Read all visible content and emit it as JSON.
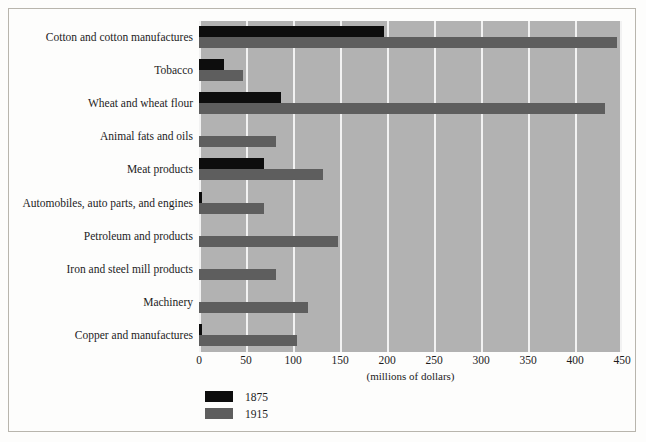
{
  "chart_data": {
    "type": "bar",
    "orientation": "horizontal",
    "title": "",
    "subtitle": "",
    "xlabel": "(millions of dollars)",
    "ylabel": "",
    "xlim": [
      0,
      450
    ],
    "xticks": [
      0,
      50,
      100,
      150,
      200,
      250,
      300,
      350,
      400,
      450
    ],
    "xticklabels": [
      "0",
      "50",
      "100",
      "150",
      "200",
      "250",
      "300",
      "350",
      "400",
      "450"
    ],
    "grid": "vertical-only",
    "legend_position": "below-left",
    "categories": [
      "Cotton and cotton manufactures",
      "Tobacco",
      "Wheat and wheat flour",
      "Animal fats and oils",
      "Meat products",
      "Automobiles, auto parts, and engines",
      "Petroleum and products",
      "Iron and steel mill products",
      "Machinery",
      "Copper and manufactures"
    ],
    "series": [
      {
        "name": "1875",
        "color": "#0d0d0d",
        "values": [
          197,
          27,
          87,
          0,
          69,
          3,
          0,
          0,
          0,
          3
        ]
      },
      {
        "name": "1915",
        "color": "#5e5e5e",
        "values": [
          445,
          47,
          432,
          82,
          132,
          69,
          148,
          82,
          116,
          104
        ]
      }
    ],
    "plot_background": "#b2b2b2",
    "gridline_color": "#f2f2f2"
  },
  "legend": {
    "items": [
      {
        "label": "1875",
        "color": "#0d0d0d"
      },
      {
        "label": "1915",
        "color": "#5e5e5e"
      }
    ]
  },
  "axis": {
    "xlabel": "(millions of dollars)"
  }
}
